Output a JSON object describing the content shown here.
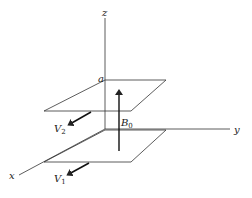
{
  "diagram": {
    "axes": {
      "z_label": "z",
      "y_label": "y",
      "x_label": "x"
    },
    "corner_label": "a",
    "field": {
      "symbol": "B",
      "subscript": "0"
    },
    "velocities": [
      {
        "symbol": "V",
        "subscript": "2",
        "plane": "upper"
      },
      {
        "symbol": "V",
        "subscript": "1",
        "plane": "lower"
      }
    ],
    "colors": {
      "line": "#222222",
      "background": "#ffffff"
    }
  }
}
